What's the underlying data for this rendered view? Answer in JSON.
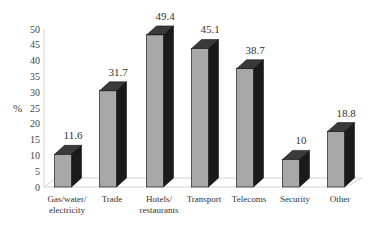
{
  "chart_data": {
    "type": "bar",
    "title": "",
    "xlabel": "",
    "ylabel": "%",
    "ylim": [
      0,
      50
    ],
    "yticks": [
      0,
      5,
      10,
      15,
      20,
      25,
      30,
      35,
      40,
      45,
      50
    ],
    "categories": [
      "Gas/water/ electricity",
      "Trade",
      "Hotels/ restaurants",
      "Transport",
      "Telecoms",
      "Security",
      "Other"
    ],
    "category_lines": [
      [
        "Gas/water/",
        "electricity"
      ],
      [
        "Trade"
      ],
      [
        "Hotels/",
        "restaurants"
      ],
      [
        "Transport"
      ],
      [
        "Telecoms"
      ],
      [
        "Security"
      ],
      [
        "Other"
      ]
    ],
    "values": [
      11.6,
      31.7,
      49.4,
      45.1,
      38.7,
      10,
      18.8
    ],
    "value_labels": [
      "11.6",
      "31.7",
      "49.4",
      "45.1",
      "38.7",
      "10",
      "18.8"
    ],
    "style": "3d-bar",
    "grid": false,
    "legend": null
  },
  "colors": {
    "bar_front": "#a8a8a8",
    "bar_side": "#1a1a1a",
    "bar_top": "#3a3a3a",
    "axis": "#c8c8c8"
  }
}
